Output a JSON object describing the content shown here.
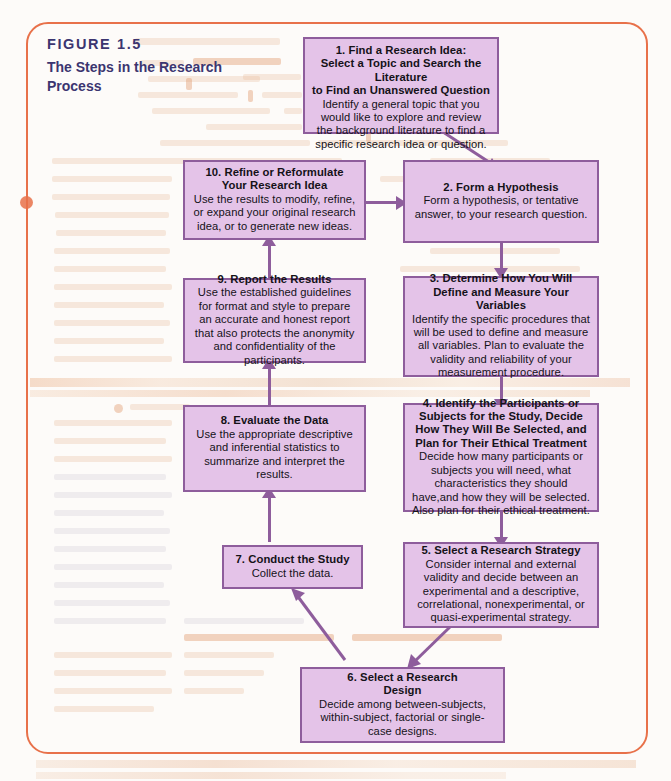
{
  "figure": {
    "number": "FIGURE 1.5",
    "title": "The Steps in the Research Process",
    "accent_color": "#e8714a",
    "caption_color": "#3b3570",
    "box_fill": "#e4c3e8",
    "box_border": "#8e5d9c"
  },
  "steps": [
    {
      "id": "step-1",
      "heading": "1. Find a Research Idea:\nSelect a Topic and Search the Literature\nto Find an Unanswered Question",
      "body": "Identify a general topic that you would like to explore and review the background literature to find a specific research idea or question."
    },
    {
      "id": "step-2",
      "heading": "2. Form a Hypothesis",
      "body": "Form a hypothesis, or tentative answer, to your research question."
    },
    {
      "id": "step-3",
      "heading": "3. Determine How You Will Define and Measure Your Variables",
      "body": "Identify the specific procedures that will be used to define and measure all variables. Plan to evaluate the validity and reliability of your measurement procedure."
    },
    {
      "id": "step-4",
      "heading": "4. Identify the Participants or Subjects for the Study, Decide How They Will Be Selected, and Plan for Their Ethical Treatment",
      "body": "Decide how many participants or subjects you will need, what characteristics they should have,and how they will be selected. Also plan for their ethical treatment."
    },
    {
      "id": "step-5",
      "heading": "5. Select a Research Strategy",
      "body": "Consider internal and external validity and decide between an experimental and a descriptive, correlational, nonexperimental, or quasi-experimental strategy."
    },
    {
      "id": "step-6",
      "heading": "6. Select a Research\nDesign",
      "body": "Decide among between-subjects, within-subject, factorial or single-case designs."
    },
    {
      "id": "step-7",
      "heading": "7. Conduct the Study",
      "body": "Collect the data."
    },
    {
      "id": "step-8",
      "heading": "8. Evaluate the Data",
      "body": "Use the appropriate descriptive and inferential statistics to summarize and interpret the results."
    },
    {
      "id": "step-9",
      "heading": "9. Report the Results",
      "body": "Use the established guidelines for format and style to prepare an accurate and honest report that also protects the anonymity and confidentiality of the participants."
    },
    {
      "id": "step-10",
      "heading": "10. Refine or Reformulate Your Research Idea",
      "body": "Use the results to modify, refine, or expand your original research idea, or to generate new ideas."
    }
  ]
}
